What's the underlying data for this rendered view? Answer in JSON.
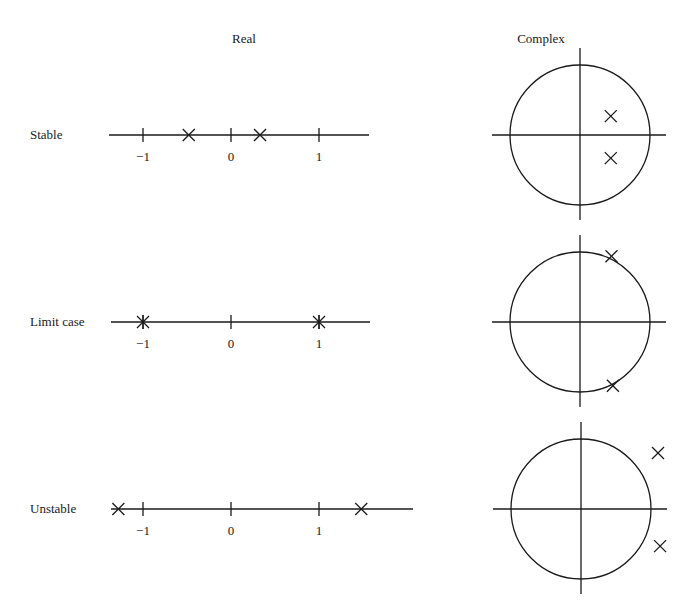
{
  "headers": {
    "real": "Real",
    "complex": "Complex"
  },
  "rows": [
    {
      "label": "Stable",
      "real": {
        "axis_y": 135,
        "x_start": 109,
        "x_end": 369,
        "ticks": [
          {
            "value": -1,
            "label": "−1"
          },
          {
            "value": 0,
            "label": "0"
          },
          {
            "value": 1,
            "label": "1"
          }
        ],
        "roots": [
          {
            "value": -0.48,
            "style": "cross"
          },
          {
            "value": 0.33,
            "style": "cross"
          }
        ]
      },
      "complex": {
        "center": [
          580,
          135
        ],
        "radius": 70,
        "roots": [
          {
            "re": 0.44,
            "im": 0.27
          },
          {
            "re": 0.44,
            "im": -0.33
          }
        ]
      }
    },
    {
      "label": "Limit case",
      "real": {
        "axis_y": 322,
        "x_start": 111,
        "x_end": 370,
        "ticks": [
          {
            "value": -1,
            "label": "−1"
          },
          {
            "value": 0,
            "label": "0"
          },
          {
            "value": 1,
            "label": "1"
          }
        ],
        "roots": [
          {
            "value": -1,
            "style": "asterisk"
          },
          {
            "value": 1,
            "style": "asterisk"
          }
        ]
      },
      "complex": {
        "center": [
          580,
          322
        ],
        "radius": 70,
        "roots": [
          {
            "re": 0.45,
            "im": 0.94
          },
          {
            "re": 0.47,
            "im": -0.91
          }
        ]
      }
    },
    {
      "label": "Unstable",
      "real": {
        "axis_y": 509,
        "x_start": 111,
        "x_end": 413,
        "ticks": [
          {
            "value": -1,
            "label": "−1"
          },
          {
            "value": 0,
            "label": "0"
          },
          {
            "value": 1,
            "label": "1"
          }
        ],
        "roots": [
          {
            "value": -1.28,
            "style": "cross"
          },
          {
            "value": 1.48,
            "style": "cross"
          }
        ]
      },
      "complex": {
        "center": [
          581,
          509
        ],
        "radius": 70,
        "roots": [
          {
            "re": 1.1,
            "im": 0.8
          },
          {
            "re": 1.13,
            "im": -0.53
          }
        ]
      }
    }
  ],
  "scale": {
    "real_zero_x": 231,
    "real_px_per_unit": 88,
    "complex_axis_overhang": 18,
    "complex_axis_left_overhang": 18
  }
}
